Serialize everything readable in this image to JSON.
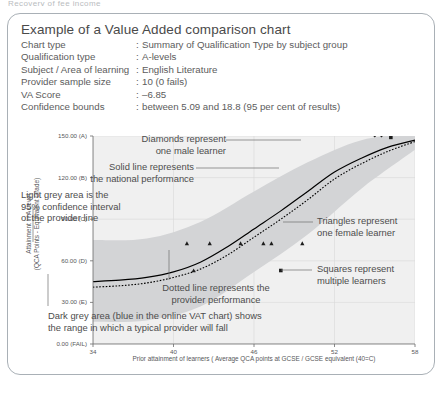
{
  "top_clipped_text": "Recovery of fee income",
  "header": {
    "title": "Example of a Value Added comparison chart",
    "rows": [
      {
        "label": "Chart type",
        "sep": ":",
        "value": "Summary of Qualification Type by subject group"
      },
      {
        "label": "Qualification type",
        "sep": ":",
        "value": "A-levels"
      },
      {
        "label": "Subject / Area of learning",
        "sep": ":",
        "value": "English Literature"
      },
      {
        "label": "Provider sample size",
        "sep": ":",
        "value": "10 (0 fails)"
      },
      {
        "label": "VA Score",
        "sep": ":",
        "value": "–6.85"
      },
      {
        "label": "Confidence bounds",
        "sep": ":",
        "value": "between 5.09 and 18.8 (95 per cent of results)"
      }
    ]
  },
  "chart_data": {
    "type": "line",
    "title": "",
    "xlabel": "Prior attainment of learners ( Average QCA points at GCSE / GCSE equivalent (40=C)",
    "ylabel": "Attainment in A Level (QCA Points - Equivalent Grade)",
    "ylabel_line1": "Attainment in A Level",
    "ylabel_line2": "(QCA Points - Equivalent Grade)",
    "xlim": [
      34,
      58
    ],
    "ylim": [
      0,
      150
    ],
    "grid": true,
    "legend_position": "annotations",
    "xticks": [
      "34",
      "40",
      "46",
      "52",
      "58"
    ],
    "xtick_values": [
      34,
      40,
      46,
      52,
      58
    ],
    "yticks": [
      "0.00 (FAIL)",
      "30.00 (E)",
      "60.00 (D)",
      "90.00 (C)",
      "120.00 (B)",
      "150.00 (A)"
    ],
    "ytick_values": [
      0,
      30,
      60,
      90,
      120,
      150
    ],
    "series": [
      {
        "name": "National performance (solid line)",
        "style": "solid",
        "x": [
          34,
          36,
          38,
          40,
          42,
          44,
          46,
          48,
          50,
          52,
          54,
          56,
          58
        ],
        "values": [
          45,
          46,
          48,
          52,
          59,
          70,
          83,
          96,
          110,
          124,
          134,
          142,
          147
        ]
      },
      {
        "name": "Provider performance (dotted line)",
        "style": "dotted",
        "x": [
          34,
          36,
          38,
          40,
          42,
          44,
          46,
          48,
          50,
          52,
          54,
          56,
          58
        ],
        "values": [
          41,
          42,
          44,
          48,
          54,
          64,
          77,
          90,
          104,
          119,
          130,
          139,
          146
        ]
      }
    ],
    "bands": [
      {
        "name": "95% confidence interval of the provider line (light grey)",
        "fill": "#d3d4d6",
        "x": [
          34,
          38,
          42,
          46,
          50,
          54,
          58
        ],
        "upper": [
          75,
          76,
          88,
          110,
          131,
          147,
          152
        ],
        "lower": [
          16,
          17,
          27,
          52,
          79,
          112,
          140
        ]
      },
      {
        "name": "Range in which a typical provider will fall (dark grey / blue online)",
        "fill": "#b6b8ba",
        "x": [
          34,
          38,
          42,
          46,
          50,
          54,
          58
        ],
        "upper": [
          61,
          62,
          74,
          97,
          120,
          140,
          150
        ],
        "lower": [
          30,
          31,
          42,
          65,
          91,
          121,
          143
        ]
      }
    ],
    "points": [
      {
        "marker": "triangle",
        "name": "one female learner",
        "x": 41.0,
        "y": 72.5
      },
      {
        "marker": "triangle",
        "name": "one female learner",
        "x": 42.7,
        "y": 72.5
      },
      {
        "marker": "triangle",
        "name": "one female learner",
        "x": 45.0,
        "y": 72.5
      },
      {
        "marker": "triangle",
        "name": "one female learner",
        "x": 46.7,
        "y": 72.5
      },
      {
        "marker": "triangle",
        "name": "one female learner",
        "x": 47.3,
        "y": 72.5
      },
      {
        "marker": "triangle",
        "name": "one female learner",
        "x": 49.6,
        "y": 72.5
      },
      {
        "marker": "triangle",
        "name": "one female learner",
        "x": 41.5,
        "y": 53.0
      },
      {
        "marker": "square",
        "name": "multiple learners",
        "x": 48.0,
        "y": 53.0
      },
      {
        "marker": "diamond",
        "name": "one male learner",
        "x": 55.0,
        "y": 150.5
      },
      {
        "marker": "diamond",
        "name": "one male learner",
        "x": 55.5,
        "y": 150.5
      },
      {
        "marker": "square",
        "name": "multiple learners",
        "x": 56.2,
        "y": 149.0
      }
    ],
    "annotations": [
      {
        "id": "diamonds",
        "line1": "Diamonds represent",
        "line2": "one male learner"
      },
      {
        "id": "solid-line",
        "line1": "Solid line represents",
        "line2": "the national performance"
      },
      {
        "id": "light-grey",
        "line1": "Light grey area is the",
        "line2": "95% confidence interval",
        "line3": "of the provider line"
      },
      {
        "id": "triangles",
        "line1": "Triangles represent",
        "line2": "one female learner"
      },
      {
        "id": "squares",
        "line1": "Squares represent",
        "line2": "multiple learners"
      },
      {
        "id": "dotted",
        "line1": "Dotted line represents the",
        "line2": "provider performance"
      },
      {
        "id": "dark-grey",
        "line1": "Dark grey area (blue in the online VAT chart) shows",
        "line2": "the range in which a typical provider will fall"
      }
    ],
    "colors": {
      "band_light": "#d3d4d6",
      "band_dark": "#b6b8ba",
      "plot_bg": "#f0f0f0",
      "line": "#000000",
      "grid": "#d8d8d8",
      "axis": "#6b6b6b"
    }
  }
}
